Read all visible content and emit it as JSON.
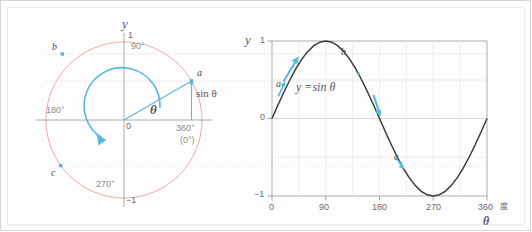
{
  "figure": {
    "title": "",
    "colors": {
      "circle": "#e8a39a",
      "accent": "#58b9e0",
      "curve": "#3a3a3a",
      "axis": "#8a8a8c",
      "grid": "#e4e4e4",
      "text": "#58585a",
      "frame": "#d6d6d6"
    }
  },
  "unit_circle": {
    "y_axis_label": "y",
    "top_value": "1",
    "bottom_value": "−1",
    "origin_label": "0",
    "angle_label": "θ",
    "sin_label": "sin θ",
    "angle_ticks": [
      {
        "name": "90deg",
        "text": "90°"
      },
      {
        "name": "180deg",
        "text": "180°"
      },
      {
        "name": "270deg",
        "text": "270°"
      },
      {
        "name": "360deg",
        "text": "360°"
      },
      {
        "name": "0deg",
        "text": "(0°)"
      }
    ],
    "points": [
      {
        "name": "a",
        "label": "a",
        "angle_deg": 30
      },
      {
        "name": "b",
        "label": "b",
        "angle_deg": 145
      },
      {
        "name": "c",
        "label": "c",
        "angle_deg": 215
      }
    ]
  },
  "chart_data": {
    "type": "line",
    "title": "",
    "equation_label": "y =sin θ",
    "xlabel": "θ",
    "ylabel": "y",
    "x_unit_label": "度",
    "xlim": [
      0,
      360
    ],
    "ylim": [
      -1,
      1
    ],
    "xticks": [
      "0",
      "90",
      "180",
      "270",
      "360"
    ],
    "xtick_values": [
      0,
      90,
      180,
      270,
      360
    ],
    "yticks": [
      "1",
      "0",
      "−1"
    ],
    "ytick_values": [
      1,
      0,
      -1
    ],
    "grid": true,
    "legend": "none",
    "series": [
      {
        "name": "y = sin θ",
        "x": [
          0,
          10,
          20,
          30,
          40,
          50,
          60,
          70,
          80,
          90,
          100,
          110,
          120,
          130,
          140,
          150,
          160,
          170,
          180,
          190,
          200,
          210,
          220,
          230,
          240,
          250,
          260,
          270,
          280,
          290,
          300,
          310,
          320,
          330,
          340,
          350,
          360
        ],
        "values": [
          0,
          0.174,
          0.342,
          0.5,
          0.643,
          0.766,
          0.866,
          0.94,
          0.985,
          1,
          0.985,
          0.94,
          0.866,
          0.766,
          0.643,
          0.5,
          0.342,
          0.174,
          0,
          -0.174,
          -0.342,
          -0.5,
          -0.643,
          -0.766,
          -0.866,
          -0.94,
          -0.985,
          -1,
          -0.985,
          -0.94,
          -0.866,
          -0.766,
          -0.643,
          -0.5,
          -0.342,
          -0.174,
          0
        ]
      }
    ],
    "annotations": [
      {
        "name": "point-a",
        "label": "a",
        "x": 30,
        "y": 0.5
      },
      {
        "name": "point-b",
        "label": "b",
        "x": 145,
        "y": 0.574
      },
      {
        "name": "point-c",
        "label": "c",
        "x": 215,
        "y": -0.574
      }
    ]
  }
}
